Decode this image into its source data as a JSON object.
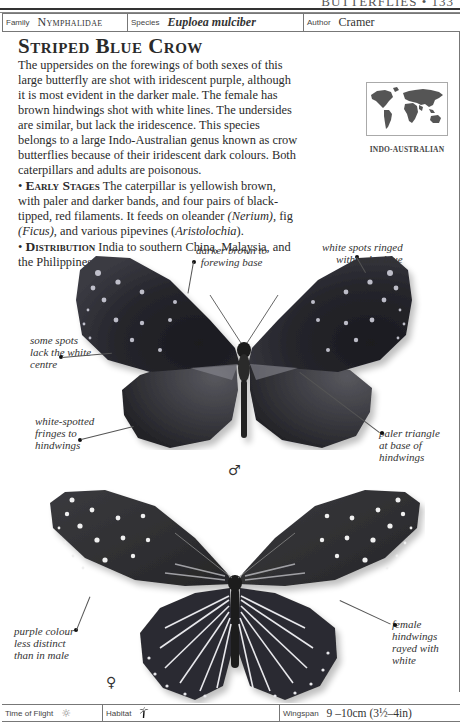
{
  "running_head": {
    "text": "BUTTERFLIES • 133"
  },
  "info_bar": {
    "family_label": "Family",
    "family_value": "Nymphalidae",
    "species_label": "Species",
    "species_value": "Euploea mulciber",
    "author_label": "Author",
    "author_value": "Cramer"
  },
  "title": "Striped Blue Crow",
  "description": "The uppersides on the forewings of both sexes of this large butterfly are shot with iridescent purple, although it is most evident in the darker male. The female has brown hindwings shot with white lines. The undersides are similar, but lack the iridescence. This species belongs to a large Indo-Australian genus known as crow butterflies because of their iridescent dark colours. Both caterpillars and adults are poisonous.",
  "early_stages": {
    "heading": "Early Stages",
    "text_1": " The caterpillar is yellowish brown, with paler and darker bands, and four pairs of black-tipped, red filaments. It feeds on oleander ",
    "em_1": "(Nerium)",
    "text_2": ", fig ",
    "em_2": "(Ficus)",
    "text_3": ", and various pipevines (",
    "em_3": "Aristolochia",
    "text_4": ")."
  },
  "distribution": {
    "heading": "Distribution",
    "text": " India to southern China, Malaysia, and the Philippines."
  },
  "map": {
    "caption": "INDO-AUSTRALIAN"
  },
  "annotations": {
    "male": {
      "darker_brown": "darker brown to\nforewing base",
      "white_spots": "white spots ringed\nwith paler blue",
      "some_spots": "some spots\nlack the white\ncentre",
      "white_spotted": "white-spotted\nfringes to\nhindwings",
      "paler_triangle": "paler triangle\nat base of\nhindwings"
    },
    "female": {
      "purple_colour": "purple colour\nless distinct\nthan in male",
      "female_hindwings": "female\nhindwings\nrayed with\nwhite"
    }
  },
  "symbols": {
    "male": "♂",
    "female": "♀"
  },
  "footer": {
    "time_label": "Time of Flight",
    "time_icon": "sun-icon",
    "habitat_label": "Habitat",
    "habitat_icon": "palm-tree-icon",
    "wingspan_label": "Wingspan",
    "wingspan_value": "9 –10cm (3½–4in)"
  }
}
